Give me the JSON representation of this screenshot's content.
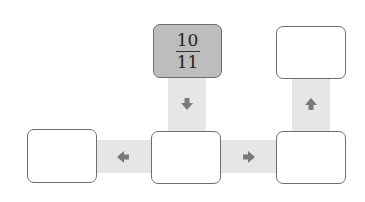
{
  "diagram": {
    "start_box": {
      "numerator": "10",
      "denominator": "11",
      "fill": "#bdbdbd"
    },
    "boxes": [
      {
        "id": "top-center",
        "value": ""
      },
      {
        "id": "top-right",
        "value": ""
      },
      {
        "id": "bottom-left",
        "value": ""
      },
      {
        "id": "bottom-center",
        "value": ""
      },
      {
        "id": "bottom-right",
        "value": ""
      }
    ],
    "arrows": [
      {
        "from": "top-center",
        "to": "bottom-center",
        "direction": "down"
      },
      {
        "from": "bottom-center",
        "to": "bottom-left",
        "direction": "left"
      },
      {
        "from": "bottom-center",
        "to": "bottom-right",
        "direction": "right"
      },
      {
        "from": "bottom-right",
        "to": "top-right",
        "direction": "up"
      }
    ],
    "colors": {
      "connector": "#e6e6e6",
      "arrow": "#7a7a7a",
      "border": "#6e6e6e"
    }
  }
}
